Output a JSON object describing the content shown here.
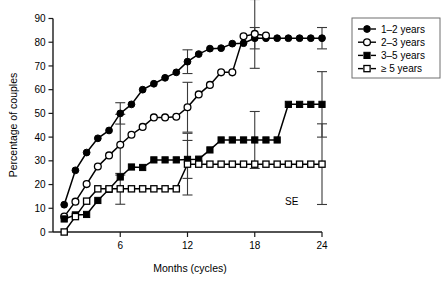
{
  "chart_data": {
    "type": "line",
    "title": "",
    "xlabel": "Months (cycles)",
    "ylabel": "Percentage of couples",
    "xlim": [
      0,
      24
    ],
    "ylim": [
      0,
      90
    ],
    "xticks": [
      6,
      12,
      18,
      24
    ],
    "yticks": [
      0,
      10,
      20,
      30,
      40,
      50,
      60,
      70,
      80,
      90
    ],
    "grid": false,
    "legend_position": "top-right",
    "annotations": [
      {
        "text": "SE",
        "x": 21.3,
        "y": 11.5
      }
    ],
    "series": [
      {
        "name": "1–2 years",
        "marker": "filled-circle",
        "x": [
          1,
          2,
          3,
          4,
          5,
          6,
          7,
          8,
          9,
          10,
          11,
          12,
          13,
          14,
          15,
          16,
          17,
          18,
          19,
          20,
          21,
          22,
          23,
          24
        ],
        "values": [
          11.5,
          26.0,
          33.5,
          39.5,
          42.8,
          50.0,
          53.8,
          60.0,
          62.5,
          65.0,
          67.3,
          71.8,
          75.0,
          77.3,
          77.5,
          79.4,
          79.6,
          81.7,
          81.7,
          81.7,
          81.7,
          81.7,
          81.7,
          81.7
        ],
        "error_bars": [
          {
            "x": 6,
            "value": 50.0,
            "se": 4.5
          },
          {
            "x": 12,
            "value": 71.8,
            "se": 5.0
          },
          {
            "x": 18,
            "value": 81.7,
            "se": 4.5
          },
          {
            "x": 24,
            "value": 81.7,
            "se": 4.5
          }
        ]
      },
      {
        "name": "2–3 years",
        "marker": "open-circle",
        "x": [
          1,
          2,
          3,
          4,
          5,
          6,
          7,
          8,
          9,
          10,
          11,
          12,
          13,
          14,
          15,
          16,
          17,
          18,
          19
        ],
        "values": [
          6.5,
          12.8,
          20.2,
          27.6,
          32.3,
          36.8,
          41.0,
          44.3,
          48.3,
          48.3,
          48.6,
          52.6,
          58.0,
          62.0,
          67.3,
          67.3,
          82.5,
          83.5,
          82.8
        ],
        "error_bars": [
          {
            "x": 6,
            "value": 36.8,
            "se": 12.8
          },
          {
            "x": 12,
            "value": 52.6,
            "se": 10.5
          },
          {
            "x": 18,
            "value": 83.5,
            "se": 14.5
          }
        ]
      },
      {
        "name": "3–5 years",
        "marker": "filled-square",
        "x": [
          1,
          2,
          3,
          4,
          5,
          6,
          7,
          8,
          9,
          10,
          11,
          12,
          13,
          14,
          15,
          16,
          17,
          18,
          19,
          20,
          21,
          22,
          23,
          24
        ],
        "values": [
          5.5,
          7.2,
          7.4,
          13.3,
          18.0,
          23.2,
          27.4,
          27.2,
          30.4,
          30.4,
          30.4,
          30.6,
          30.7,
          34.6,
          38.8,
          38.8,
          38.8,
          38.8,
          38.8,
          38.8,
          53.8,
          53.8,
          53.8,
          53.8
        ],
        "error_bars": [
          {
            "x": 12,
            "value": 30.6,
            "se": 8.0
          },
          {
            "x": 18,
            "value": 38.8,
            "se": 12.0
          },
          {
            "x": 24,
            "value": 53.8,
            "se": 13.8
          }
        ]
      },
      {
        "name": "≥ 5 years",
        "marker": "open-square",
        "x": [
          1,
          2,
          3,
          4,
          5,
          6,
          7,
          8,
          9,
          10,
          11,
          12,
          13,
          14,
          15,
          16,
          17,
          18,
          19,
          20,
          21,
          22,
          23,
          24
        ],
        "values": [
          0.0,
          6.5,
          13.0,
          18.2,
          18.2,
          18.2,
          18.2,
          18.2,
          18.2,
          18.2,
          18.2,
          28.6,
          28.6,
          28.6,
          28.6,
          28.6,
          28.6,
          28.6,
          28.6,
          28.6,
          28.6,
          28.6,
          28.6,
          28.6
        ],
        "error_bars": [
          {
            "x": 6,
            "value": 18.2,
            "se": 6.5
          },
          {
            "x": 12,
            "value": 28.6,
            "se": 13.0
          },
          {
            "x": 24,
            "value": 28.6,
            "se": 17.0
          }
        ]
      }
    ]
  },
  "legend": {
    "entries": [
      {
        "label": "1–2 years",
        "marker": "filled-circle"
      },
      {
        "label": "2–3 years",
        "marker": "open-circle"
      },
      {
        "label": "3–5 years",
        "marker": "filled-square"
      },
      {
        "label": "≥ 5 years",
        "marker": "open-square"
      }
    ]
  },
  "axes": {
    "x_title": "Months (cycles)",
    "y_title": "Percentage of couples",
    "x_tick_labels": [
      "6",
      "12",
      "18",
      "24"
    ],
    "y_tick_labels": [
      "0",
      "10",
      "20",
      "30",
      "40",
      "50",
      "60",
      "70",
      "80",
      "90"
    ]
  },
  "annotation": {
    "se_label": "SE"
  }
}
